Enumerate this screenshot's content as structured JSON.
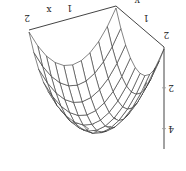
{
  "chart_data": {
    "type": "surface3d",
    "title": "",
    "orientation": "rotated-180",
    "xlabel": "x",
    "ylabel": "y",
    "zlabel": "",
    "x_ticks": [
      "1",
      "2"
    ],
    "y_ticks": [
      "1",
      "2"
    ],
    "z_ticks": [
      "2",
      "4"
    ],
    "xlim": [
      0,
      2
    ],
    "ylim": [
      0,
      2
    ],
    "zlim": [
      0,
      5
    ],
    "grid_resolution": 10,
    "surface": {
      "description": "dome-shaped wireframe mesh peaking near the centre of the x-y domain",
      "function": "z = 4.5 - ((x-1)^2 + (y-1)^2) * 2.2",
      "x": [
        0,
        0.2,
        0.4,
        0.6,
        0.8,
        1.0,
        1.2,
        1.4,
        1.6,
        1.8,
        2.0
      ],
      "y": [
        0,
        0.2,
        0.4,
        0.6,
        0.8,
        1.0,
        1.2,
        1.4,
        1.6,
        1.8,
        2.0
      ]
    },
    "colors": {
      "mesh": "#333333",
      "axes": "#444444",
      "background": "#ffffff"
    }
  }
}
